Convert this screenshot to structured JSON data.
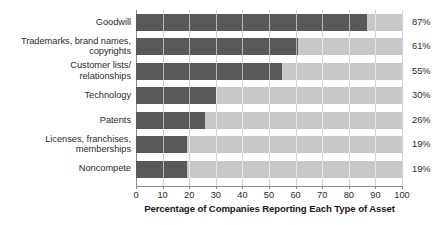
{
  "chart_data": {
    "type": "bar",
    "orientation": "horizontal",
    "title": "",
    "xlabel": "Percentage of Companies Reporting Each Type of Asset",
    "ylabel": "",
    "xlim": [
      0,
      100
    ],
    "grid": true,
    "legend": null,
    "xticks": [
      "0",
      "10",
      "20",
      "30",
      "40",
      "50",
      "60",
      "70",
      "80",
      "90",
      "100"
    ],
    "xtick_values": [
      0,
      10,
      20,
      30,
      40,
      50,
      60,
      70,
      80,
      90,
      100
    ],
    "categories": [
      "Goodwill",
      "Trademarks, brand names, copyrights",
      "Customer lists/relationships",
      "Technology",
      "Patents",
      "Licenses, franchises, memberships",
      "Noncompete"
    ],
    "category_lines": [
      [
        "Goodwill"
      ],
      [
        "Trademarks, brand names,",
        "copyrights"
      ],
      [
        "Customer lists/",
        "relationships"
      ],
      [
        "Technology"
      ],
      [
        "Patents"
      ],
      [
        "Licenses, franchises,",
        "memberships"
      ],
      [
        "Noncompete"
      ]
    ],
    "values": [
      87,
      61,
      55,
      30,
      26,
      19,
      19
    ],
    "value_labels": [
      "87%",
      "61%",
      "55%",
      "30%",
      "26%",
      "19%",
      "19%"
    ],
    "colors": {
      "bar_fill": "#595959",
      "bar_track": "#c8c8c8",
      "gridline": "#d2d2d2",
      "axis": "#8d8d8d",
      "text": "#2b2b2b",
      "title_text": "#1a1a1a",
      "background": "#ffffff"
    }
  }
}
